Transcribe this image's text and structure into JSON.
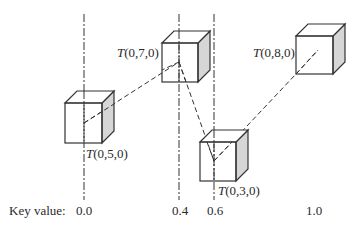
{
  "diagram": {
    "key_label": "Key value:",
    "key_ticks": [
      {
        "label": "0.0",
        "x": 84
      },
      {
        "label": "0.4",
        "x": 179
      },
      {
        "label": "0.6",
        "x": 214
      },
      {
        "label": "1.0",
        "x": 314
      }
    ],
    "keyframes": [
      {
        "label_prefix": "T",
        "label_args": "(0,5,0)",
        "key": "0.0"
      },
      {
        "label_prefix": "T",
        "label_args": "(0,7,0)",
        "key": "0.4"
      },
      {
        "label_prefix": "T",
        "label_args": "(0,3,0)",
        "key": "0.6"
      },
      {
        "label_prefix": "T",
        "label_args": "(0,8,0)",
        "key": "1.0"
      }
    ],
    "colors": {
      "stroke": "#333333",
      "side_face": "#d6d6d6",
      "background": "#ffffff"
    }
  }
}
